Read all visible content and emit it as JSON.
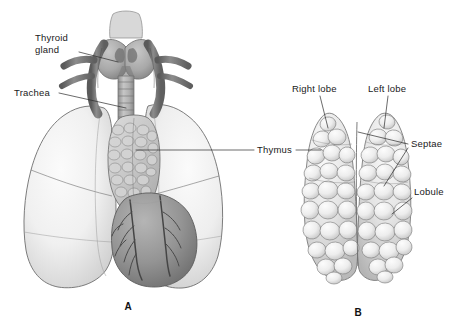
{
  "figure": {
    "background_color": "#ffffff",
    "width": 459,
    "height": 332
  },
  "panels": [
    {
      "id": "A",
      "letter": "A",
      "letter_x": 128,
      "letter_y": 310,
      "caption_subject": "Anterior view of thorax showing thymus between the lungs"
    },
    {
      "id": "B",
      "letter": "B",
      "letter_x": 358,
      "letter_y": 316,
      "caption_subject": "Isolated thymus gland showing lobes and lobules"
    }
  ],
  "labels": [
    {
      "id": "thyroid-gland",
      "text": "Thyroid\ngland",
      "line1": "Thyroid",
      "line2": "gland",
      "x": 35,
      "y": 41,
      "anchor": "start",
      "panel": "A"
    },
    {
      "id": "trachea",
      "text": "Trachea",
      "line1": "Trachea",
      "line2": "",
      "x": 14,
      "y": 96,
      "anchor": "start",
      "panel": "A"
    },
    {
      "id": "thymus",
      "text": "Thymus",
      "line1": "Thymus",
      "line2": "",
      "x": 257,
      "y": 153,
      "anchor": "start",
      "panel": "A"
    },
    {
      "id": "right-lobe",
      "text": "Right lobe",
      "line1": "Right lobe",
      "line2": "",
      "x": 292,
      "y": 92,
      "anchor": "start",
      "panel": "B"
    },
    {
      "id": "left-lobe",
      "text": "Left lobe",
      "line1": "Left lobe",
      "line2": "",
      "x": 368,
      "y": 92,
      "anchor": "start",
      "panel": "B"
    },
    {
      "id": "septae",
      "text": "Septae",
      "line1": "Septae",
      "line2": "",
      "x": 411,
      "y": 147,
      "anchor": "start",
      "panel": "B"
    },
    {
      "id": "lobule",
      "text": "Lobule",
      "line1": "Lobule",
      "line2": "",
      "x": 414,
      "y": 195,
      "anchor": "start",
      "panel": "B"
    }
  ],
  "colors": {
    "background": "#ffffff",
    "lung_fill": "#f0f0f0",
    "lung_shadow": "#c8c8c8",
    "lung_outline": "#6e6e6e",
    "thymus_fill": "#e9e9e9",
    "thymus_lobule_light": "#f4f4f4",
    "thymus_lobule_shadow": "#bdbdbd",
    "thymus_outline": "#7a7a7a",
    "thyroid_fill": "#a8a8a8",
    "trachea_fill": "#b4b4b4",
    "vessel_dark": "#6a6a6a",
    "vessel_darker": "#4f4f4f",
    "heart_fill": "#949494",
    "heart_shadow": "#6d6d6d",
    "coronary_vessel": "#4a4a4a",
    "label_text": "#1a1a1a",
    "leader_line": "#2b2b2b"
  }
}
